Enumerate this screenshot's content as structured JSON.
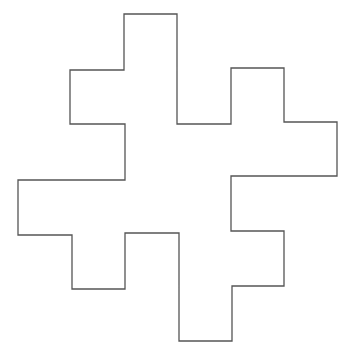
{
  "diagram": {
    "type": "polyomino-outline",
    "stroke_color": "#555555",
    "fill_color": "#ffffff",
    "background": "#ffffff",
    "points": "124,14 177,14 177,124 231,124 231,68 284,68 284,122 337,122 337,176 231,176 231,231 284,231 284,286 232,286 232,341 179,341 179,233 125,233 125,289 72,289 72,235 18,235 18,180 125,180 125,124 70,124 70,70 124,70"
  }
}
